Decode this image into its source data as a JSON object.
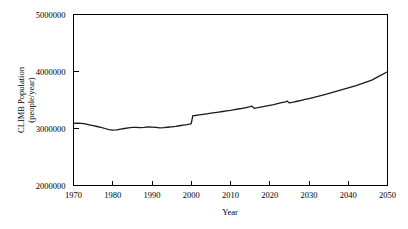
{
  "chart_data": {
    "type": "line",
    "title": "",
    "xlabel": "Year",
    "ylabel": "CLIMB Population (people/year)",
    "ylabel_line1": "CLIMB Population",
    "ylabel_line2": "(people/year)",
    "xlim": [
      1970,
      2050
    ],
    "ylim": [
      2000000,
      5000000
    ],
    "xticks": [
      1970,
      1980,
      1990,
      2000,
      2010,
      2020,
      2030,
      2040,
      2050
    ],
    "xtick_labels": [
      "1970",
      "1980",
      "1990",
      "2000",
      "2010",
      "2020",
      "2030",
      "2040",
      "2050"
    ],
    "yticks": [
      2000000,
      3000000,
      4000000,
      5000000
    ],
    "ytick_labels": [
      "2000000",
      "3000000",
      "4000000",
      "5000000"
    ],
    "grid": false,
    "legend": false,
    "legend_position": "none",
    "line_color": "#1a1a1a",
    "series": [
      {
        "name": "CLIMB Population",
        "x": [
          1970,
          1971,
          1972,
          1973,
          1974,
          1975,
          1976,
          1977,
          1978,
          1979,
          1980,
          1981,
          1982,
          1983,
          1984,
          1985,
          1986,
          1987,
          1988,
          1989,
          1990,
          1991,
          1992,
          1993,
          1994,
          1995,
          1996,
          1997,
          1998,
          1999,
          1999.6,
          2000,
          2000.4,
          2001,
          2002,
          2003,
          2004,
          2005,
          2006,
          2007,
          2008,
          2009,
          2010,
          2011,
          2012,
          2013,
          2014,
          2015,
          2015.5,
          2016,
          2017,
          2018,
          2019,
          2020,
          2021,
          2022,
          2023,
          2024,
          2024.4,
          2025,
          2026,
          2027,
          2028,
          2029,
          2030,
          2032,
          2034,
          2036,
          2038,
          2040,
          2042,
          2044,
          2046,
          2048,
          2050
        ],
        "y": [
          3090000,
          3095000,
          3090000,
          3080000,
          3065000,
          3050000,
          3035000,
          3020000,
          3000000,
          2980000,
          2972000,
          2975000,
          2990000,
          3000000,
          3010000,
          3018000,
          3018000,
          3015000,
          3018000,
          3028000,
          3025000,
          3018000,
          3012000,
          3015000,
          3022000,
          3030000,
          3038000,
          3048000,
          3058000,
          3068000,
          3075000,
          3085000,
          3225000,
          3228000,
          3238000,
          3248000,
          3258000,
          3268000,
          3278000,
          3288000,
          3298000,
          3308000,
          3318000,
          3330000,
          3342000,
          3355000,
          3368000,
          3382000,
          3392000,
          3355000,
          3365000,
          3378000,
          3392000,
          3406000,
          3420000,
          3436000,
          3452000,
          3468000,
          3482000,
          3448000,
          3462000,
          3478000,
          3494000,
          3510000,
          3526000,
          3560000,
          3596000,
          3634000,
          3672000,
          3712000,
          3754000,
          3800000,
          3850000,
          3922000,
          3995000
        ]
      }
    ],
    "annotations": [
      {
        "year": 2000,
        "note": "step increase"
      },
      {
        "year": 2015.5,
        "note": "downward step"
      },
      {
        "year": 2024.4,
        "note": "downward step"
      }
    ]
  },
  "axes": {
    "x_title": "Year",
    "y_title_line1": "CLIMB Population",
    "y_title_line2": "(people/year)"
  }
}
